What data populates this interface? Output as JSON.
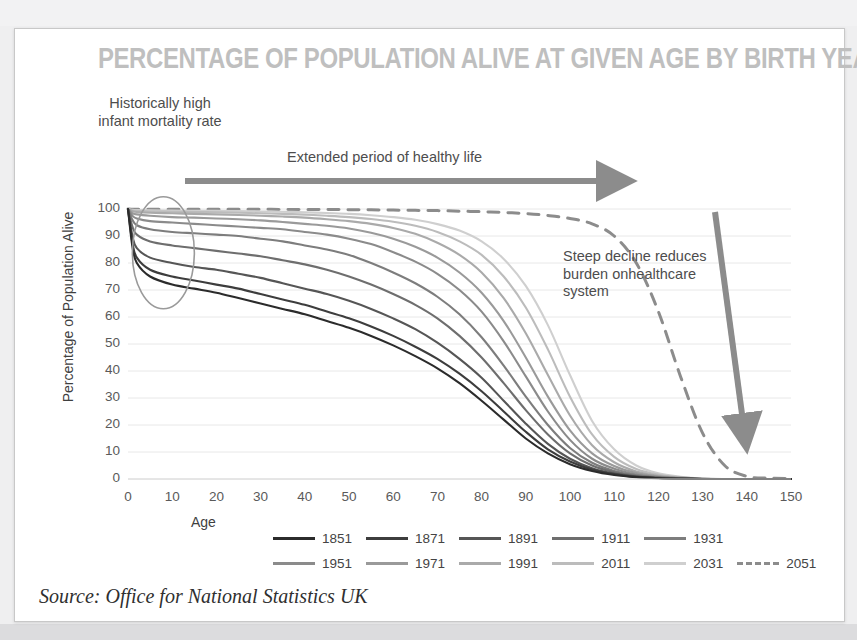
{
  "card": {
    "title": "PERCENTAGE OF POPULATION ALIVE AT GIVEN AGE BY BIRTH YEAR",
    "source": "Source: Office for National Statistics UK"
  },
  "annotations": {
    "infant": "Historically high infant mortality rate",
    "extended": "Extended period of healthy life",
    "steep": "Steep decline reduces burden onhealthcare system"
  },
  "colors": {
    "title": "#bfbfbf",
    "annotation": "#4d4d4d",
    "arrow": "#8c8c8c",
    "grid": "#e8e8e8",
    "ellipse": "#9a9a9a",
    "card_border": "#c8c8c8"
  },
  "chart_data": {
    "type": "line",
    "title": "PERCENTAGE OF POPULATION ALIVE AT GIVEN AGE BY BIRTH YEAR",
    "xlabel": "Age",
    "ylabel": "Percentage of Population Alive",
    "xlim": [
      0,
      150
    ],
    "ylim": [
      0,
      100
    ],
    "xticks": [
      0,
      10,
      20,
      30,
      40,
      50,
      60,
      70,
      80,
      90,
      100,
      110,
      120,
      130,
      140,
      150
    ],
    "yticks": [
      0,
      10,
      20,
      30,
      40,
      50,
      60,
      70,
      80,
      90,
      100
    ],
    "grid": true,
    "legend_position": "bottom",
    "x": [
      0,
      1,
      2,
      5,
      10,
      15,
      20,
      25,
      30,
      35,
      40,
      45,
      50,
      55,
      60,
      65,
      70,
      75,
      80,
      85,
      90,
      95,
      100,
      105,
      110,
      115,
      120,
      125,
      130,
      135,
      140,
      145,
      150
    ],
    "series": [
      {
        "name": "1851",
        "color": "#2b2b2b",
        "dash": false,
        "values": [
          100,
          86,
          80,
          75,
          72,
          70.5,
          69,
          67,
          65,
          63,
          61,
          58.5,
          56,
          53,
          49.5,
          45.5,
          41,
          35.5,
          29,
          22,
          15,
          9.5,
          5.5,
          3,
          1.5,
          0.7,
          0.3,
          0.1,
          0,
          0,
          0,
          0,
          0
        ]
      },
      {
        "name": "1871",
        "color": "#3d3d3d",
        "dash": false,
        "values": [
          100,
          87.5,
          82,
          77.5,
          75,
          73.5,
          72,
          70.5,
          68.5,
          66.5,
          64.5,
          62,
          59.5,
          56.5,
          53,
          49,
          44.5,
          39,
          32.5,
          25,
          17.5,
          11,
          6.5,
          3.5,
          1.8,
          0.8,
          0.35,
          0.12,
          0,
          0,
          0,
          0,
          0
        ]
      },
      {
        "name": "1891",
        "color": "#565656",
        "dash": false,
        "values": [
          100,
          90,
          85.5,
          82,
          80,
          78.5,
          77.5,
          76,
          74.5,
          72.5,
          70.5,
          68.5,
          66,
          63,
          59.5,
          55.5,
          50.5,
          44.5,
          37.5,
          29,
          20.5,
          13,
          7.5,
          4,
          2,
          0.9,
          0.4,
          0.15,
          0,
          0,
          0,
          0,
          0
        ]
      },
      {
        "name": "1911",
        "color": "#6e6e6e",
        "dash": false,
        "values": [
          100,
          93.5,
          90.5,
          88,
          86.5,
          85.5,
          84.5,
          83.5,
          82.5,
          81,
          79.5,
          77.5,
          75,
          72,
          68.5,
          64.5,
          59.5,
          53,
          45,
          35.5,
          25.5,
          16.5,
          9.5,
          5,
          2.5,
          1.1,
          0.5,
          0.2,
          0,
          0,
          0,
          0,
          0
        ]
      },
      {
        "name": "1931",
        "color": "#7d7d7d",
        "dash": false,
        "values": [
          100,
          96,
          94,
          92.5,
          91.5,
          91,
          90.5,
          90,
          89,
          88,
          86.5,
          85,
          83,
          80,
          76.5,
          72.5,
          67.5,
          61,
          52.5,
          42,
          30.5,
          20,
          11.5,
          6,
          3,
          1.4,
          0.6,
          0.25,
          0,
          0,
          0,
          0,
          0
        ]
      },
      {
        "name": "1951",
        "color": "#8b8b8b",
        "dash": false,
        "values": [
          100,
          97.5,
          96.5,
          95.5,
          95,
          94.5,
          94,
          93.5,
          93,
          92.5,
          91.5,
          90.5,
          89,
          87,
          84,
          80.5,
          76,
          70,
          62,
          51,
          38,
          25,
          14.5,
          7.5,
          3.8,
          1.7,
          0.75,
          0.3,
          0,
          0,
          0,
          0,
          0
        ]
      },
      {
        "name": "1971",
        "color": "#9a9a9a",
        "dash": false,
        "values": [
          100,
          98.5,
          98,
          97.5,
          97,
          96.8,
          96.5,
          96.2,
          95.8,
          95.2,
          94.5,
          93.8,
          92.8,
          91.2,
          89,
          86,
          82,
          76.5,
          69,
          58.5,
          45,
          30.5,
          18,
          9.5,
          4.8,
          2.2,
          0.95,
          0.4,
          0.1,
          0,
          0,
          0,
          0
        ]
      },
      {
        "name": "1991",
        "color": "#aaaaaa",
        "dash": false,
        "values": [
          100,
          99.2,
          98.9,
          98.6,
          98.4,
          98.2,
          98,
          97.8,
          97.5,
          97.2,
          96.8,
          96.2,
          95.5,
          94.5,
          93,
          90.8,
          87.5,
          83,
          76.5,
          67,
          54,
          38.5,
          23.5,
          12.5,
          6.2,
          2.8,
          1.2,
          0.5,
          0.12,
          0,
          0,
          0,
          0
        ]
      },
      {
        "name": "2011",
        "color": "#bcbcbc",
        "dash": false,
        "values": [
          100,
          99.5,
          99.3,
          99.1,
          99,
          98.9,
          98.8,
          98.6,
          98.4,
          98.2,
          97.9,
          97.5,
          97,
          96.3,
          95.3,
          93.8,
          91.5,
          88,
          83,
          75,
          63.5,
          48,
          30.5,
          16.5,
          8.2,
          3.7,
          1.6,
          0.65,
          0.15,
          0,
          0,
          0,
          0
        ]
      },
      {
        "name": "2031",
        "color": "#cfcfcf",
        "dash": false,
        "values": [
          100,
          99.7,
          99.6,
          99.5,
          99.4,
          99.35,
          99.3,
          99.2,
          99.1,
          99,
          98.8,
          98.5,
          98.2,
          97.7,
          97,
          96,
          94.4,
          92,
          88,
          81.5,
          71.5,
          57,
          38.5,
          21.5,
          11,
          5,
          2.1,
          0.85,
          0.2,
          0,
          0,
          0,
          0
        ]
      },
      {
        "name": "2051",
        "color": "#8c8c8c",
        "dash": true,
        "values": [
          100,
          99.9,
          99.9,
          99.9,
          99.9,
          99.9,
          99.9,
          99.9,
          99.9,
          99.85,
          99.8,
          99.8,
          99.75,
          99.7,
          99.6,
          99.5,
          99.4,
          99.2,
          99,
          98.7,
          98.3,
          97.6,
          96.5,
          94.5,
          90,
          80,
          62,
          38,
          17,
          5,
          1,
          0.3,
          0.2
        ]
      }
    ]
  }
}
